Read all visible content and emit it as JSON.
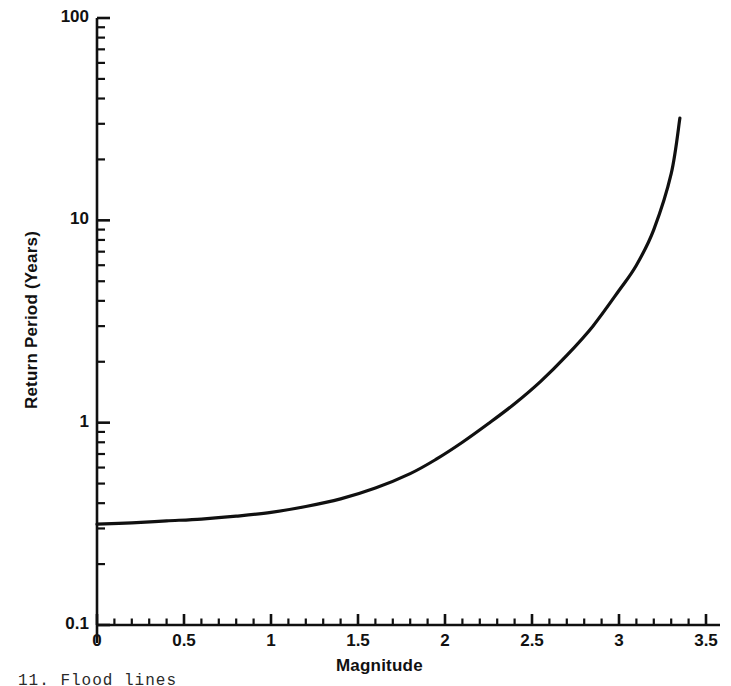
{
  "figure": {
    "caption_partial": "11.  Flood  lines"
  },
  "chart_data": {
    "type": "line",
    "title": "",
    "xlabel": "Magnitude",
    "ylabel": "Return Period (Years)",
    "xscale": "linear",
    "yscale": "log",
    "xlim": [
      0,
      3.5
    ],
    "ylim": [
      0.1,
      100
    ],
    "grid": false,
    "legend": null,
    "xticks": [
      0,
      0.5,
      1,
      1.5,
      2,
      2.5,
      3,
      3.5
    ],
    "xticklabels": [
      "0",
      "0.5",
      "1",
      "1.5",
      "2",
      "2.5",
      "3",
      "3.5"
    ],
    "xminor_step": 0.1,
    "yticks": [
      0.1,
      1,
      10,
      100
    ],
    "yticklabels": [
      "0.1",
      "1",
      "10",
      "100"
    ],
    "yminor_decade_multipliers": [
      2,
      3,
      4,
      5,
      6,
      7,
      8,
      9
    ],
    "line_color": "#101010",
    "line_width": 3.2,
    "series": [
      {
        "name": "Flood return period",
        "x": [
          0.0,
          0.2,
          0.4,
          0.6,
          0.8,
          1.0,
          1.2,
          1.4,
          1.6,
          1.8,
          1.95,
          2.1,
          2.25,
          2.4,
          2.55,
          2.7,
          2.85,
          3.0,
          3.1,
          3.2,
          3.3,
          3.35
        ],
        "y": [
          0.315,
          0.32,
          0.327,
          0.334,
          0.345,
          0.36,
          0.385,
          0.42,
          0.475,
          0.56,
          0.66,
          0.8,
          0.99,
          1.24,
          1.6,
          2.15,
          3.0,
          4.5,
          6.0,
          9.0,
          17.0,
          32.0
        ]
      }
    ]
  }
}
